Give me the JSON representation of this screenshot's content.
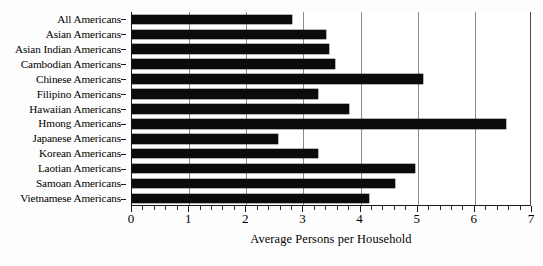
{
  "chart_data": {
    "type": "bar",
    "orientation": "horizontal",
    "title": "",
    "xlabel": "Average Persons per Household",
    "ylabel": "",
    "xlim": [
      0,
      7
    ],
    "xticks": [
      0,
      1,
      2,
      3,
      4,
      5,
      6,
      7
    ],
    "xtick_labels": [
      "0",
      "1",
      "2",
      "3",
      "4",
      "5",
      "6",
      "7"
    ],
    "minor_tick_step": 0.2,
    "grid": "vertical-major",
    "legend": "none",
    "bar_color": "#0b0b0b",
    "categories": [
      "All Americans",
      "Asian Americans",
      "Asian Indian Americans",
      "Cambodian Americans",
      "Chinese Americans",
      "Filipino Americans",
      "Hawaiian Americans",
      "Hmong Americans",
      "Japanese Americans",
      "Korean Americans",
      "Laotian Americans",
      "Samoan Americans",
      "Vietnamese Americans"
    ],
    "values": [
      2.8,
      3.4,
      3.45,
      3.55,
      5.1,
      3.25,
      3.8,
      6.55,
      2.55,
      3.25,
      4.95,
      4.6,
      4.15
    ]
  }
}
